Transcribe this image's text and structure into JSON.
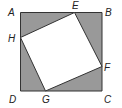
{
  "diagram": {
    "colors": {
      "shade": "#999999",
      "inner": "#ffffff",
      "stroke": "#333333",
      "label": "#222222"
    },
    "outer_square": {
      "vertices": {
        "A": [
          20.5,
          12.5
        ],
        "B": [
          102,
          12.5
        ],
        "C": [
          102,
          91
        ],
        "D": [
          20.5,
          91
        ]
      }
    },
    "inner_square": {
      "vertices": {
        "E": [
          74.5,
          12.5
        ],
        "F": [
          102,
          66.5
        ],
        "G": [
          45.5,
          91
        ],
        "H": [
          20.5,
          37.5
        ]
      }
    },
    "labels": {
      "A": "A",
      "B": "B",
      "C": "C",
      "D": "D",
      "E": "E",
      "F": "F",
      "G": "G",
      "H": "H"
    }
  }
}
